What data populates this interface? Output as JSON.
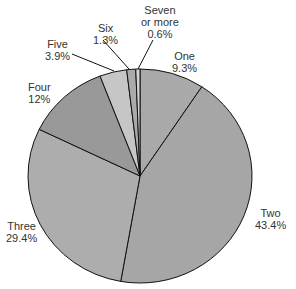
{
  "chart_data": {
    "type": "pie",
    "title": "",
    "start_angle_deg": 0,
    "direction": "clockwise",
    "slices": [
      {
        "label": "One",
        "value": 9.3,
        "value_label": "9.3%",
        "color": "#a9a9a9"
      },
      {
        "label": "Two",
        "value": 43.4,
        "value_label": "43.4%",
        "color": "#a6a6a6"
      },
      {
        "label": "Three",
        "value": 29.4,
        "value_label": "29.4%",
        "color": "#adadad"
      },
      {
        "label": "Four",
        "value": 12.0,
        "value_label": "12%",
        "color": "#999999"
      },
      {
        "label": "Five",
        "value": 3.9,
        "value_label": "3.9%",
        "color": "#c6c6c6"
      },
      {
        "label": "Six",
        "value": 1.3,
        "value_label": "1.3%",
        "color": "#aaaaaa"
      },
      {
        "label": "Seven or more",
        "value": 0.6,
        "value_label": "0.6%",
        "color": "#d4d4d4"
      }
    ],
    "labels": {
      "one": {
        "name": "One",
        "pct": "9.3%"
      },
      "two": {
        "name": "Two",
        "pct": "43.4%"
      },
      "three": {
        "name": "Three",
        "pct": "29.4%"
      },
      "four": {
        "name": "Four",
        "pct": "12%"
      },
      "five": {
        "name": "Five",
        "pct": "3.9%"
      },
      "six": {
        "name": "Six",
        "pct": "1.3%"
      },
      "seven_line1": "Seven",
      "seven_line2": "or more",
      "seven_pct": "0.6%"
    },
    "legend": "none"
  }
}
